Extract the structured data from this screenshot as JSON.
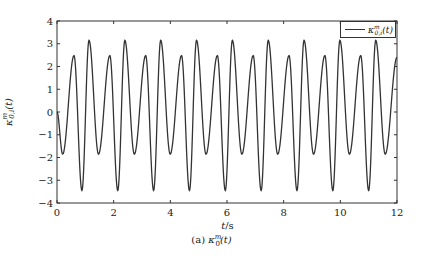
{
  "chart_data": {
    "type": "line",
    "title": "",
    "xlabel": "t/s",
    "ylabel": "κ_{0,i}^m(t)",
    "caption": "(a) κ_0^m(t)",
    "xlim": [
      0,
      12
    ],
    "ylim": [
      -4,
      4
    ],
    "x_ticks": [
      0,
      2,
      4,
      6,
      8,
      10,
      12
    ],
    "y_ticks": [
      -4,
      -3,
      -2,
      -1,
      0,
      1,
      2,
      3,
      4
    ],
    "grid": false,
    "legend": {
      "position": "upper right",
      "entries": [
        "κ_{0,i}^m(t)"
      ]
    },
    "series": [
      {
        "name": "κ_{0,i}^m(t)",
        "color": "#333333",
        "period_s": 1.265,
        "start": {
          "t": 0,
          "value": 0.0
        },
        "pattern_per_period": [
          {
            "t_offset": 0.2,
            "value": -1.85,
            "kind": "shallow-min"
          },
          {
            "t_offset": 0.6,
            "value": 2.48,
            "kind": "small-max"
          },
          {
            "t_offset": 0.88,
            "value": -3.45,
            "kind": "deep-min"
          },
          {
            "t_offset": 1.13,
            "value": 3.15,
            "kind": "big-max"
          }
        ],
        "end": {
          "t": 12,
          "value": 2.4
        }
      }
    ]
  },
  "labels": {
    "xlabel_italic": "t",
    "xlabel_rest": "/s",
    "ylabel": "κ",
    "ylabel_sup": "m",
    "ylabel_sub": "0,i",
    "ylabel_arg": "(t)",
    "caption_prefix": "(a) ",
    "caption_sym": "κ",
    "caption_sup": "m",
    "caption_sub": "0",
    "caption_arg": "(t)",
    "legend_sym": "κ",
    "legend_sup": "m",
    "legend_sub": "0,i",
    "legend_arg": "(t)"
  }
}
